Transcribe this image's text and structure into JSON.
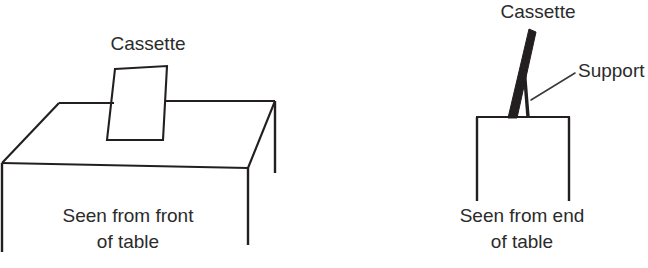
{
  "figure": {
    "background_color": "#ffffff",
    "line_color": "#231f20",
    "text_color": "#2b2b2b"
  },
  "left_panel": {
    "name": "front-view",
    "cassette_label": "Cassette",
    "caption_line1": "Seen from front",
    "caption_line2": "of table",
    "objects": [
      "table-top-parallelogram",
      "table-front-edge",
      "table-legs",
      "cassette-rectangle"
    ]
  },
  "right_panel": {
    "name": "end-view",
    "cassette_label": "Cassette",
    "support_label": "Support",
    "caption_line1": "Seen from end",
    "caption_line2": "of table",
    "objects": [
      "table-end-outline",
      "table-legs",
      "cassette-angled-bar",
      "support-strut",
      "support-leader-line"
    ]
  }
}
